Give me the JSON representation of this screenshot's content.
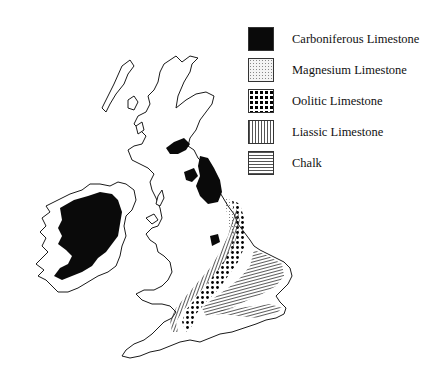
{
  "figure": {
    "type": "geological-distribution-map",
    "region": "British Isles"
  },
  "legend": {
    "items": [
      {
        "key": "carboniferous",
        "label": "Carboniferous Limestone",
        "pattern": "solid-black",
        "color": "#0a0a0a"
      },
      {
        "key": "magnesium",
        "label": "Magnesium Limestone",
        "pattern": "fine-stipple",
        "color": "#888888"
      },
      {
        "key": "oolitic",
        "label": "Oolitic Limestone",
        "pattern": "large-dots",
        "color": "#000000"
      },
      {
        "key": "liassic",
        "label": "Liassic Limestone",
        "pattern": "vertical-lines",
        "color": "#555555"
      },
      {
        "key": "chalk",
        "label": "Chalk",
        "pattern": "horizontal-lines",
        "color": "#555555"
      }
    ]
  },
  "map": {
    "outline_color": "#1a1a1a",
    "background": "#ffffff"
  }
}
